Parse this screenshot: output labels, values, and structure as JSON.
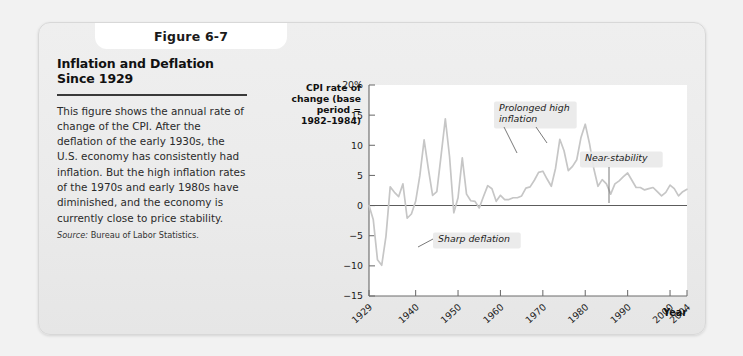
{
  "figure": {
    "tab_label": "Figure 6-7",
    "title": "Inflation and Deflation Since 1929",
    "body": "This figure shows the annual rate of change of the CPI. After the deflation of the early 1930s, the U.S. economy has consistently had inflation. But the high inflation rates of the 1970s and early 1980s have diminished, and the economy is currently close to price stability.",
    "source_label": "Source:",
    "source_text": " Bureau of Labor Statistics."
  },
  "colors": {
    "card_background": "#ebebeb",
    "plot_background": "#ffffff",
    "series_line": "#c6c6c6",
    "axis": "#6d6d6d",
    "zero_line": "#5c5c5c",
    "annotation_background": "#e9e9e9",
    "text": "#1c1c1c"
  },
  "chart_data": {
    "type": "line",
    "title": "",
    "ylabel": "CPI rate of change (base period = 1982–1984)",
    "xlabel": "Year",
    "ylim": [
      -15,
      20
    ],
    "xlim": [
      1929,
      2004
    ],
    "grid": false,
    "legend": "none",
    "ytick_labels": [
      "20%",
      "15",
      "10",
      "5",
      "0",
      "−5",
      "−10",
      "−15"
    ],
    "ytick_values": [
      20,
      15,
      10,
      5,
      0,
      -5,
      -10,
      -15
    ],
    "xtick_labels": [
      "1929",
      "1940",
      "1950",
      "1960",
      "1970",
      "1980",
      "1990",
      "2000",
      "2004"
    ],
    "xtick_values": [
      1929,
      1940,
      1950,
      1960,
      1970,
      1980,
      1990,
      2000,
      2004
    ],
    "series": [
      {
        "name": "CPI rate of change",
        "x": [
          1929,
          1930,
          1931,
          1932,
          1933,
          1934,
          1935,
          1936,
          1937,
          1938,
          1939,
          1940,
          1941,
          1942,
          1943,
          1944,
          1945,
          1946,
          1947,
          1948,
          1949,
          1950,
          1951,
          1952,
          1953,
          1954,
          1955,
          1956,
          1957,
          1958,
          1959,
          1960,
          1961,
          1962,
          1963,
          1964,
          1965,
          1966,
          1967,
          1968,
          1969,
          1970,
          1971,
          1972,
          1973,
          1974,
          1975,
          1976,
          1977,
          1978,
          1979,
          1980,
          1981,
          1982,
          1983,
          1984,
          1985,
          1986,
          1987,
          1988,
          1989,
          1990,
          1991,
          1992,
          1993,
          1994,
          1995,
          1996,
          1997,
          1998,
          1999,
          2000,
          2001,
          2002,
          2003,
          2004
        ],
        "values": [
          0.0,
          -2.3,
          -9.0,
          -9.9,
          -5.1,
          3.1,
          2.2,
          1.5,
          3.6,
          -2.1,
          -1.4,
          0.7,
          5.0,
          10.9,
          6.1,
          1.7,
          2.3,
          8.3,
          14.4,
          8.1,
          -1.2,
          1.3,
          7.9,
          1.9,
          0.8,
          0.7,
          -0.4,
          1.5,
          3.3,
          2.8,
          0.7,
          1.7,
          1.0,
          1.0,
          1.3,
          1.3,
          1.6,
          2.9,
          3.1,
          4.2,
          5.5,
          5.7,
          4.4,
          3.2,
          6.2,
          11.0,
          9.1,
          5.8,
          6.5,
          7.6,
          11.3,
          13.5,
          10.3,
          6.2,
          3.2,
          4.3,
          3.6,
          1.9,
          3.6,
          4.1,
          4.8,
          5.4,
          4.2,
          3.0,
          3.0,
          2.6,
          2.8,
          3.0,
          2.3,
          1.6,
          2.2,
          3.4,
          2.8,
          1.6,
          2.3,
          2.7
        ]
      }
    ],
    "annotations": [
      {
        "text": "Sharp deflation",
        "target_year": 1932,
        "target_value": -9.5
      },
      {
        "text": "Prolonged high inflation",
        "target_year": 1974,
        "target_value": 11.0
      },
      {
        "text": "Near-stability",
        "target_year": 1994,
        "target_value": 2.6
      }
    ]
  }
}
